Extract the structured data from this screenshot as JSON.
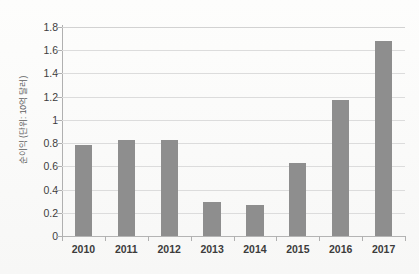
{
  "chart_data": {
    "type": "bar",
    "title": "",
    "subtitle": "",
    "xlabel": "",
    "ylabel": "순이익 (단위: 10억 달러)",
    "categories": [
      "2010",
      "2011",
      "2012",
      "2013",
      "2014",
      "2015",
      "2016",
      "2017"
    ],
    "values": [
      0.78,
      0.83,
      0.83,
      0.29,
      0.27,
      0.63,
      1.17,
      1.68
    ],
    "series": [
      {
        "name": "순이익",
        "values": [
          0.78,
          0.83,
          0.83,
          0.29,
          0.27,
          0.63,
          1.17,
          1.68
        ]
      }
    ],
    "ylim": [
      0,
      1.8
    ],
    "y_ticks": [
      0,
      0.2,
      0.4,
      0.6,
      0.8,
      1,
      1.2,
      1.4,
      1.6,
      1.8
    ],
    "y_tick_labels": [
      "0",
      "0.2",
      "0.4",
      "0.6",
      "0.8",
      "1",
      "1.2",
      "1.4",
      "1.6",
      "1.8"
    ],
    "grid": true,
    "grid_axis": "y",
    "legend": false,
    "legend_position": "none",
    "bar_color": "#8e8e8e",
    "gridline_color": "#dcdcdc",
    "axis_color": "#b0b0b0",
    "background_color": "#fbfbfa",
    "text_color": "#3c3c3c"
  }
}
